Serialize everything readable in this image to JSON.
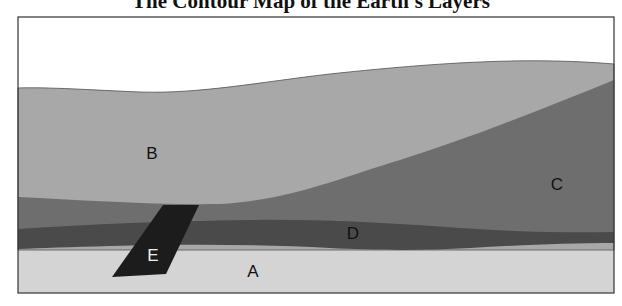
{
  "title": "The Contour Map of the Earth's Layers",
  "colors": {
    "background": "#ffffff",
    "frame": "#333333",
    "layer_A": "#d4d4d4",
    "layer_B": "#a8a8a8",
    "layer_C": "#6e6e6e",
    "layer_D": "#4a4a4a",
    "layer_E": "#1c1c1c"
  },
  "layers": [
    {
      "id": "A",
      "label": "A",
      "label_color": "#111111"
    },
    {
      "id": "B",
      "label": "B",
      "label_color": "#111111"
    },
    {
      "id": "C",
      "label": "C",
      "label_color": "#111111"
    },
    {
      "id": "D",
      "label": "D",
      "label_color": "#111111"
    },
    {
      "id": "E",
      "label": "E",
      "label_color": "#f0f0f0"
    }
  ]
}
